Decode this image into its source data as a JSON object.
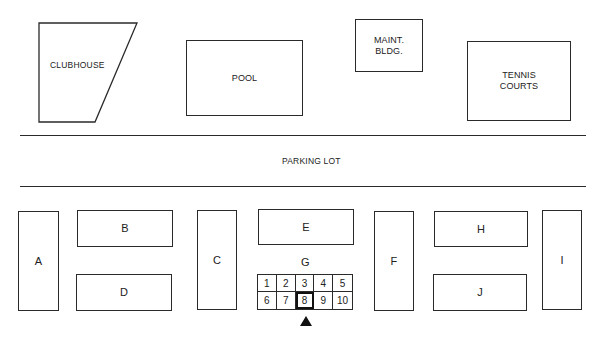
{
  "diagram": {
    "facilities": {
      "clubhouse": {
        "label": "CLUBHOUSE"
      },
      "pool": {
        "label": "POOL"
      },
      "maintenance": {
        "label": "MAINT.\nBLDG."
      },
      "tennis": {
        "label": "TENNIS\nCOURTS"
      }
    },
    "parking_lot": {
      "label": "PARKING LOT"
    },
    "buildings": [
      {
        "id": "A",
        "label": "A"
      },
      {
        "id": "B",
        "label": "B"
      },
      {
        "id": "C",
        "label": "C"
      },
      {
        "id": "D",
        "label": "D"
      },
      {
        "id": "E",
        "label": "E"
      },
      {
        "id": "F",
        "label": "F"
      },
      {
        "id": "H",
        "label": "H"
      },
      {
        "id": "I",
        "label": "I"
      },
      {
        "id": "J",
        "label": "J"
      }
    ],
    "building_g": {
      "label": "G",
      "units": [
        "1",
        "2",
        "3",
        "4",
        "5",
        "6",
        "7",
        "8",
        "9",
        "10"
      ],
      "highlighted_unit": "8",
      "marker": "triangle-up pointing at unit 8"
    },
    "colors": {
      "line": "#2a2a2a",
      "background": "#ffffff",
      "text": "#222222"
    }
  }
}
